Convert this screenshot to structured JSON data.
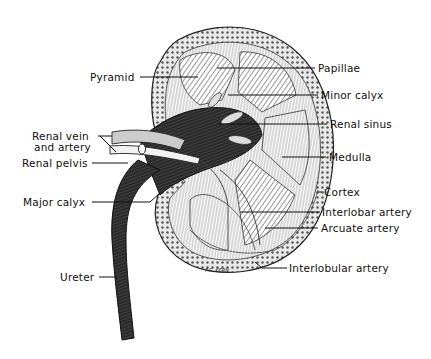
{
  "figure": {
    "signature": "P.S. KERN",
    "labels_left": [
      {
        "id": "pyramid",
        "text": "Pyramid",
        "x": 90,
        "y": 71
      },
      {
        "id": "renal-vein-artery-1",
        "text": "Renal vein",
        "x": 32,
        "y": 132
      },
      {
        "id": "renal-vein-artery-2",
        "text": "and artery",
        "x": 34,
        "y": 143
      },
      {
        "id": "renal-pelvis",
        "text": "Renal pelvis",
        "x": 22,
        "y": 158
      },
      {
        "id": "major-calyx",
        "text": "Major calyx",
        "x": 23,
        "y": 196
      },
      {
        "id": "ureter",
        "text": "Ureter",
        "x": 60,
        "y": 272
      }
    ],
    "labels_right": [
      {
        "id": "papillae",
        "text": "Papillae",
        "x": 317,
        "y": 62
      },
      {
        "id": "minor-calyx",
        "text": "Minor calyx",
        "x": 321,
        "y": 90
      },
      {
        "id": "renal-sinus",
        "text": "Renal sinus",
        "x": 330,
        "y": 119
      },
      {
        "id": "medulla",
        "text": "Medulla",
        "x": 329,
        "y": 152
      },
      {
        "id": "cortex",
        "text": "Cortex",
        "x": 324,
        "y": 187
      },
      {
        "id": "interlobar-artery",
        "text": "Interlobar artery",
        "x": 322,
        "y": 207
      },
      {
        "id": "arcuate-artery",
        "text": "Arcuate artery",
        "x": 321,
        "y": 222
      },
      {
        "id": "interlobular-artery",
        "text": "Interlobular artery",
        "x": 289,
        "y": 262
      }
    ]
  }
}
